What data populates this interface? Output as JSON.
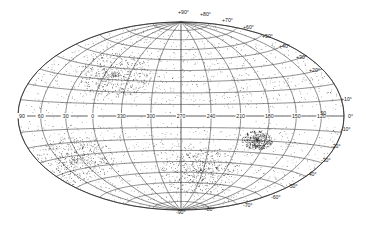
{
  "map": {
    "projection": "aitoff-hammer",
    "center": {
      "x": 181,
      "y": 116
    },
    "semi_axes": {
      "rx": 163,
      "ry": 94
    },
    "colors": {
      "background": "#ffffff",
      "grid": "#333333",
      "dots": "#1a1a1a",
      "text": "#222222"
    },
    "longitude_labels": [
      "90",
      "60",
      "30",
      "0",
      "330",
      "300",
      "270",
      "240",
      "210",
      "180",
      "150",
      "120",
      "90"
    ],
    "equator_label": "0°",
    "north_latitude_labels": [
      "+90°",
      "+80°",
      "+70°",
      "+60°",
      "+50°",
      "+40°",
      "+30°",
      "+20°",
      "+10°"
    ],
    "south_latitude_labels": [
      "-10°",
      "-20°",
      "-30°",
      "-40°",
      "-50°",
      "-60°",
      "-70°",
      "-80°",
      "-90°"
    ],
    "latitude_step_deg": 10,
    "longitude_step_deg": 30,
    "dense_regions": [
      {
        "name": "upper-left-cluster",
        "x": 115,
        "y": 75,
        "spread": 28
      },
      {
        "name": "lower-left-band",
        "x": 75,
        "y": 160,
        "spread": 30
      },
      {
        "name": "lower-center-band",
        "x": 200,
        "y": 170,
        "spread": 30
      },
      {
        "name": "right-cluster",
        "x": 257,
        "y": 140,
        "spread": 12
      }
    ]
  }
}
